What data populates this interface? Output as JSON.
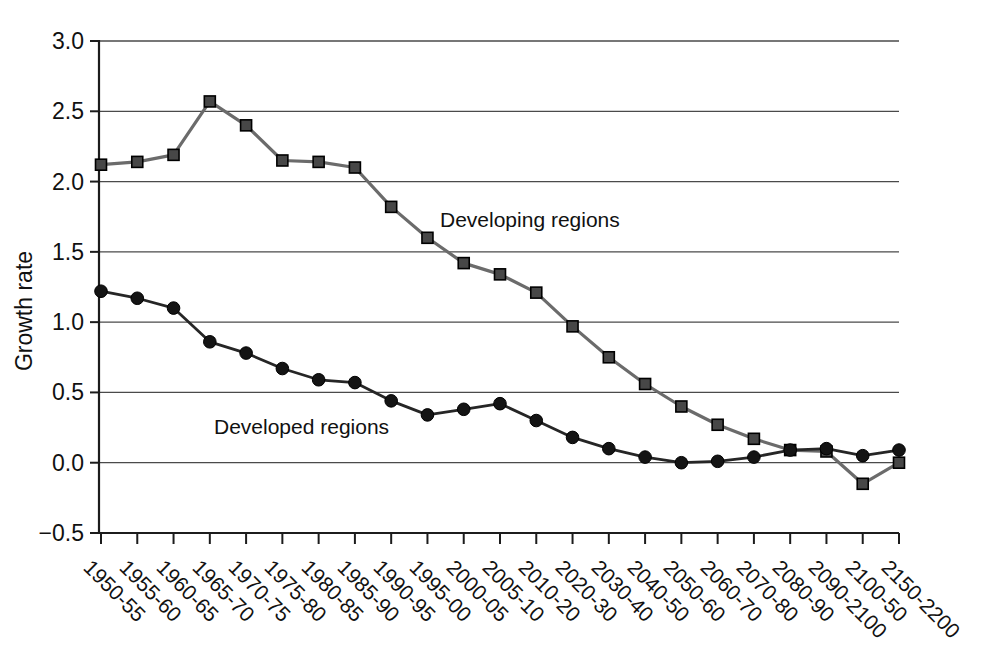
{
  "chart_data": {
    "type": "line",
    "title": "",
    "xlabel": "",
    "ylabel": "Growth rate",
    "ylim": [
      -0.5,
      3.0
    ],
    "ytick_values": [
      3.0,
      2.5,
      2.0,
      1.5,
      1.0,
      0.5,
      0.0,
      -0.5
    ],
    "ytick_labels": [
      "3.0",
      "2.5",
      "2.0",
      "1.5",
      "1.0",
      "0.5",
      "0.0",
      "−0.5"
    ],
    "grid": "horizontal",
    "legend_position": "inline-annotations",
    "categories": [
      "1950-55",
      "1955-60",
      "1960-65",
      "1965-70",
      "1970-75",
      "1975-80",
      "1980-85",
      "1985-90",
      "1990-95",
      "1995-00",
      "2000-05",
      "2005-10",
      "2010-20",
      "2020-30",
      "2030-40",
      "2040-50",
      "2050-60",
      "2060-70",
      "2070-80",
      "2080-90",
      "2090-2100",
      "2100-50",
      "2150-2200"
    ],
    "series": [
      {
        "name": "Developing regions",
        "marker": "square",
        "line_color": "#6b6b6b",
        "line_width": 3.2,
        "marker_fill": "#474747",
        "marker_edge": "#000000",
        "values": [
          2.12,
          2.14,
          2.19,
          2.57,
          2.4,
          2.15,
          2.14,
          2.1,
          1.82,
          1.6,
          1.42,
          1.34,
          1.21,
          0.97,
          0.75,
          0.56,
          0.4,
          0.27,
          0.17,
          0.09,
          0.08,
          -0.15,
          0.0
        ]
      },
      {
        "name": "Developed regions",
        "marker": "circle",
        "line_color": "#262626",
        "line_width": 2.8,
        "marker_fill": "#141414",
        "marker_edge": "#000000",
        "values": [
          1.22,
          1.17,
          1.1,
          0.86,
          0.78,
          0.67,
          0.59,
          0.57,
          0.44,
          0.34,
          0.38,
          0.42,
          0.3,
          0.18,
          0.1,
          0.04,
          0.0,
          0.01,
          0.04,
          0.09,
          0.1,
          0.05,
          0.09
        ]
      }
    ],
    "colors": {
      "background": "#ffffff",
      "axis": "#1c1c1c",
      "grid": "#4a4a4a",
      "text": "#111111"
    }
  }
}
